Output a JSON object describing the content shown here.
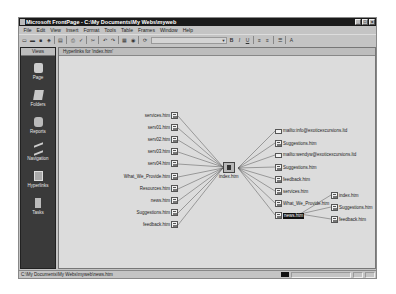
{
  "window": {
    "title": "Microsoft FrontPage - C:\\My Documents\\My Webs\\myweb",
    "controls": [
      "_",
      "□",
      "x"
    ]
  },
  "menu": [
    "File",
    "Edit",
    "View",
    "Insert",
    "Format",
    "Tools",
    "Table",
    "Frames",
    "Window",
    "Help"
  ],
  "toolbar": {
    "buttons": [
      "new-page",
      "open",
      "save",
      "publish",
      "folder-list",
      "print",
      "spelling",
      "cut",
      "undo",
      "redo",
      "insert-component",
      "hyperlink",
      "refresh"
    ],
    "style_dropdown": "",
    "format_buttons": [
      "B",
      "I",
      "U",
      "align-left",
      "align-center",
      "bullets",
      "font-color"
    ]
  },
  "views": {
    "header": "Views",
    "items": [
      {
        "label": "Page",
        "icon": "page-icon"
      },
      {
        "label": "Folders",
        "icon": "folder-icon"
      },
      {
        "label": "Reports",
        "icon": "reports-icon"
      },
      {
        "label": "Navigation",
        "icon": "navigation-icon"
      },
      {
        "label": "Hyperlinks",
        "icon": "hyperlinks-icon",
        "active": true
      },
      {
        "label": "Tasks",
        "icon": "tasks-icon"
      }
    ]
  },
  "main": {
    "header": "Hyperlinks for 'index.htm'",
    "center": {
      "label": "index.htm"
    },
    "incoming": [
      "services.htm",
      "serv01.htm",
      "serv02.htm",
      "serv03.htm",
      "serv04.htm",
      "What_We_Provide.htm",
      "Resources.htm",
      "news.htm",
      "Suggestions.htm",
      "feedback.htm"
    ],
    "outgoing": [
      {
        "label": "mailto:info@exoticexcursions.ltd",
        "type": "mail"
      },
      {
        "label": "Suggestions.htm",
        "type": "page"
      },
      {
        "label": "mailto:wendyw@exoticexcursions.ltd",
        "type": "mail"
      },
      {
        "label": "Suggestions.htm",
        "type": "page"
      },
      {
        "label": "feedback.htm",
        "type": "page"
      },
      {
        "label": "services.htm",
        "type": "page"
      },
      {
        "label": "What_We_Provide.htm",
        "type": "page"
      },
      {
        "label": "news.htm",
        "type": "page",
        "selected": true
      }
    ],
    "sub_links": [
      "index.htm",
      "Suggestions.htm",
      "feedback.htm"
    ]
  },
  "status": {
    "path": "C:\\My Documents\\My Webs\\myweb\\news.htm"
  }
}
